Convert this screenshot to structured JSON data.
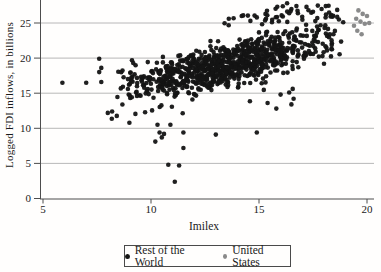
{
  "chart_data": {
    "type": "scatter",
    "title": "",
    "xlabel": "Imilex",
    "ylabel": "Logged FDI inflows, in billions",
    "x_ticks": [
      5,
      10,
      15,
      20
    ],
    "y_ticks": [
      0,
      5,
      10,
      15,
      20,
      25
    ],
    "x_range_shown": [
      4.8,
      20.6
    ],
    "y_range_shown": [
      0,
      28.2
    ],
    "grid": "horizontal-only",
    "gridline_color": "#a6a6a6",
    "axis_color": "#4d4d4d",
    "legend_position": "bottom-center",
    "series": [
      {
        "name": "Rest of the World",
        "color": "#141414",
        "marker_diameter_px": 4.6,
        "points_explicit": [
          [
            5.9,
            16.5
          ],
          [
            7.0,
            16.5
          ],
          [
            7.7,
            16.6
          ],
          [
            7.6,
            18.0
          ],
          [
            7.7,
            18.6
          ],
          [
            7.6,
            19.9
          ],
          [
            8.0,
            12.2
          ],
          [
            8.2,
            12.4
          ],
          [
            9.0,
            10.8
          ],
          [
            10.2,
            8.1
          ],
          [
            10.3,
            10.5
          ],
          [
            10.9,
            10.5
          ],
          [
            10.4,
            9.4
          ],
          [
            10.6,
            9.2
          ],
          [
            10.5,
            8.7
          ],
          [
            11.5,
            9.4
          ],
          [
            13.0,
            9.1
          ],
          [
            11.5,
            7.2
          ],
          [
            10.8,
            4.8
          ],
          [
            11.3,
            4.7
          ],
          [
            11.1,
            2.4
          ],
          [
            14.9,
            9.4
          ],
          [
            15.4,
            13.6
          ],
          [
            15.8,
            12.8
          ],
          [
            16.5,
            13.4
          ],
          [
            16.6,
            14.2
          ],
          [
            16.0,
            14.8
          ],
          [
            16.4,
            15.1
          ],
          [
            13.6,
            25.6
          ],
          [
            14.2,
            26.0
          ],
          [
            14.6,
            25.3
          ],
          [
            14.9,
            25.8
          ],
          [
            15.3,
            26.3
          ],
          [
            15.6,
            25.1
          ],
          [
            16.1,
            27.4
          ],
          [
            16.3,
            27.8
          ],
          [
            16.5,
            27.0
          ],
          [
            16.8,
            26.4
          ],
          [
            17.0,
            25.9
          ],
          [
            17.2,
            27.3
          ],
          [
            17.5,
            26.6
          ],
          [
            17.7,
            25.7
          ],
          [
            17.9,
            27.0
          ],
          [
            18.1,
            26.2
          ],
          [
            18.4,
            25.9
          ],
          [
            18.7,
            25.5
          ],
          [
            18.9,
            25.1
          ]
        ],
        "dense_cloud_approximation": {
          "comment": "Core cloud too dense to resolve individual points; reproduced from these read-off distribution parameters.",
          "n": 900,
          "seed": 12,
          "x_min": 8.0,
          "x_max": 19.1,
          "trend_intercept": 9.4,
          "trend_slope": 0.72,
          "noise_sd": 1.5,
          "low_tail_prob": 0.055,
          "low_tail_extra": 4.0,
          "y_clip_min": 2.2,
          "y_clip_max": 25.9,
          "upper_fringe": {
            "n": 46,
            "x_min": 13.0,
            "x_max": 18.8,
            "y_min": 24.6,
            "y_max": 27.5,
            "left_sparse_x": 15.0,
            "left_sparse_ymax": 26.2
          }
        }
      },
      {
        "name": "United States",
        "color": "#8a8a8a",
        "marker_diameter_px": 4.6,
        "points": [
          [
            19.4,
            24.6
          ],
          [
            19.5,
            25.6
          ],
          [
            19.55,
            23.9
          ],
          [
            19.6,
            26.8
          ],
          [
            19.7,
            25.2
          ],
          [
            19.75,
            23.4
          ],
          [
            19.8,
            26.3
          ],
          [
            19.9,
            24.9
          ],
          [
            20.0,
            26.0
          ],
          [
            20.1,
            25.0
          ]
        ]
      }
    ]
  }
}
